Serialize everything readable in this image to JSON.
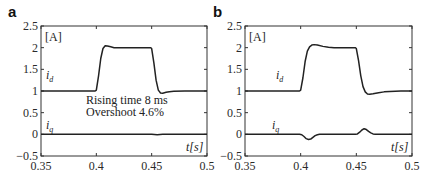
{
  "chart_data": [
    {
      "type": "line",
      "panel_label": "a",
      "unit_label": "[A]",
      "xlabel": "t[s]",
      "ylabel": "",
      "xlim": [
        0.35,
        0.5
      ],
      "ylim": [
        -0.5,
        2.5
      ],
      "xticks": [
        0.35,
        0.4,
        0.45,
        0.5
      ],
      "xtick_labels": [
        "0.35",
        "0.4",
        "0.45",
        "0.5"
      ],
      "yticks": [
        -0.5,
        0,
        0.5,
        1,
        1.5,
        2,
        2.5
      ],
      "ytick_labels": [
        "−0.5",
        "0",
        "0.5",
        "1",
        "1.5",
        "2",
        "2.5"
      ],
      "grid": false,
      "annotations": [
        "Rising time 8 ms",
        "Overshoot 4.6%"
      ],
      "series": [
        {
          "name": "i_d",
          "label_main": "i",
          "label_sub": "d",
          "x": [
            0.35,
            0.399,
            0.4,
            0.402,
            0.404,
            0.406,
            0.408,
            0.41,
            0.413,
            0.416,
            0.42,
            0.43,
            0.44,
            0.449,
            0.45,
            0.452,
            0.454,
            0.456,
            0.458,
            0.46,
            0.463,
            0.466,
            0.47,
            0.48,
            0.49,
            0.5
          ],
          "values": [
            1.0,
            1.0,
            1.02,
            1.35,
            1.75,
            1.98,
            2.046,
            2.04,
            2.02,
            2.0,
            2.0,
            2.0,
            2.0,
            2.0,
            1.98,
            1.65,
            1.25,
            1.02,
            0.955,
            0.95,
            0.97,
            0.985,
            0.995,
            1.0,
            1.0,
            1.0
          ]
        },
        {
          "name": "i_q",
          "label_main": "i",
          "label_sub": "q",
          "x": [
            0.35,
            0.4,
            0.45,
            0.455,
            0.46,
            0.5
          ],
          "values": [
            0.0,
            0.0,
            0.0,
            -0.01,
            0.0,
            0.0
          ]
        }
      ]
    },
    {
      "type": "line",
      "panel_label": "b",
      "unit_label": "[A]",
      "xlabel": "t[s]",
      "ylabel": "",
      "xlim": [
        0.35,
        0.5
      ],
      "ylim": [
        -0.5,
        2.5
      ],
      "xticks": [
        0.35,
        0.4,
        0.45,
        0.5
      ],
      "xtick_labels": [
        "0.35",
        "0.4",
        "0.45",
        "0.5"
      ],
      "yticks": [
        -0.5,
        0,
        0.5,
        1,
        1.5,
        2,
        2.5
      ],
      "ytick_labels": [
        "−0.5",
        "0",
        "0.5",
        "1",
        "1.5",
        "2",
        "2.5"
      ],
      "grid": false,
      "annotations": [],
      "series": [
        {
          "name": "i_d",
          "label_main": "i",
          "label_sub": "d",
          "x": [
            0.35,
            0.399,
            0.4,
            0.402,
            0.404,
            0.406,
            0.408,
            0.41,
            0.412,
            0.415,
            0.42,
            0.425,
            0.43,
            0.44,
            0.449,
            0.45,
            0.452,
            0.454,
            0.456,
            0.458,
            0.46,
            0.462,
            0.465,
            0.47,
            0.475,
            0.48,
            0.49,
            0.5
          ],
          "values": [
            1.0,
            1.0,
            1.02,
            1.3,
            1.68,
            1.92,
            2.02,
            2.06,
            2.07,
            2.06,
            2.03,
            2.01,
            2.0,
            2.0,
            2.0,
            1.98,
            1.7,
            1.35,
            1.1,
            0.98,
            0.93,
            0.925,
            0.935,
            0.96,
            0.98,
            0.99,
            1.0,
            1.0
          ]
        },
        {
          "name": "i_q",
          "label_main": "i",
          "label_sub": "q",
          "x": [
            0.35,
            0.399,
            0.401,
            0.403,
            0.405,
            0.407,
            0.409,
            0.411,
            0.413,
            0.415,
            0.417,
            0.42,
            0.449,
            0.451,
            0.453,
            0.455,
            0.457,
            0.459,
            0.461,
            0.463,
            0.465,
            0.467,
            0.47,
            0.5
          ],
          "values": [
            0.0,
            0.0,
            -0.01,
            -0.05,
            -0.1,
            -0.12,
            -0.11,
            -0.07,
            -0.03,
            -0.01,
            0.0,
            0.0,
            0.0,
            0.01,
            0.05,
            0.1,
            0.13,
            0.11,
            0.07,
            0.035,
            0.01,
            0.0,
            0.0,
            0.0
          ]
        }
      ]
    }
  ]
}
